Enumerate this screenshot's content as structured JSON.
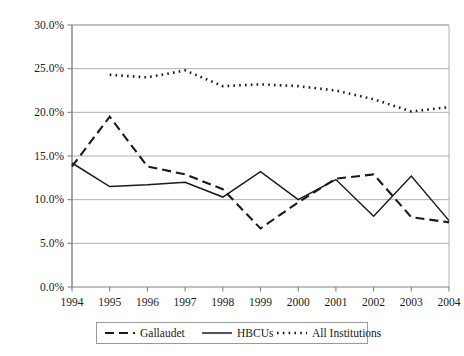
{
  "chart_data": {
    "type": "line",
    "title": "",
    "subtitle": "",
    "xlabel": "",
    "ylabel": "",
    "x": [
      1994,
      1995,
      1996,
      1997,
      1998,
      1999,
      2000,
      2001,
      2002,
      2003,
      2004
    ],
    "xtick_labels": [
      "1994",
      "1995",
      "1996",
      "1997",
      "1998",
      "1999",
      "2000",
      "2001",
      "2002",
      "2003",
      "2004"
    ],
    "ytick_labels": [
      "0.0%",
      "5.0%",
      "10.0%",
      "15.0%",
      "20.0%",
      "25.0%",
      "30.0%"
    ],
    "ytick_values": [
      0,
      5,
      10,
      15,
      20,
      25,
      30
    ],
    "ylim": [
      0,
      30
    ],
    "grid": "horizontal",
    "legend_position": "bottom-center",
    "series": [
      {
        "name": "Gallaudet",
        "style": "dashed",
        "color": "#1a1a1a",
        "x": [
          1994,
          1995,
          1996,
          1997,
          1998,
          1999,
          2000,
          2001,
          2002,
          2003,
          2004
        ],
        "values": [
          13.8,
          19.5,
          13.8,
          12.9,
          11.2,
          6.7,
          9.7,
          12.4,
          12.9,
          8.0,
          7.4
        ]
      },
      {
        "name": "HBCUs",
        "style": "solid",
        "color": "#1a1a1a",
        "x": [
          1994,
          1995,
          1996,
          1997,
          1998,
          1999,
          2000,
          2001,
          2002,
          2003,
          2004
        ],
        "values": [
          14.2,
          11.5,
          11.7,
          12.0,
          10.3,
          13.2,
          10.0,
          12.3,
          8.1,
          12.7,
          7.6
        ]
      },
      {
        "name": "All Institutions",
        "style": "dotted",
        "color": "#1a1a1a",
        "x": [
          1995,
          1996,
          1997,
          1998,
          1999,
          2000,
          2001,
          2002,
          2003,
          2004
        ],
        "values": [
          24.3,
          24.0,
          24.8,
          23.0,
          23.2,
          23.0,
          22.5,
          21.5,
          20.1,
          20.6
        ]
      }
    ]
  },
  "legend": {
    "items": [
      {
        "label": "Gallaudet",
        "style": "dashed"
      },
      {
        "label": "HBCUs",
        "style": "solid"
      },
      {
        "label": "All Institutions",
        "style": "dotted"
      }
    ]
  },
  "plot_area": {
    "left": 72,
    "right": 449,
    "top": 25,
    "bottom": 287
  },
  "colors": {
    "axis": "#808080",
    "grid": "#a6a6a6",
    "plot_border": "#b3b3b3",
    "series": "#1a1a1a",
    "text": "#1a1a1a",
    "legend_border": "#9a9a9a",
    "background": "#ffffff"
  }
}
